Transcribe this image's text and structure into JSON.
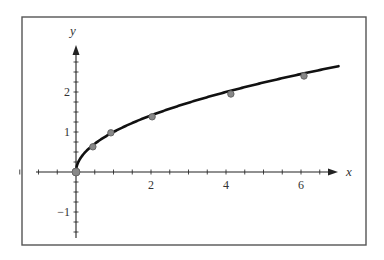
{
  "chart_data": {
    "type": "line",
    "title": "",
    "xlabel": "x",
    "ylabel": "y",
    "xlim": [
      -1.6,
      7.0
    ],
    "ylim": [
      -1.7,
      3.2
    ],
    "x_ticks": [
      2,
      4,
      6
    ],
    "x_tick_labels": [
      "2",
      "4",
      "6"
    ],
    "y_ticks": [
      -1,
      1,
      2
    ],
    "y_tick_labels": [
      "−1",
      "1",
      "2"
    ],
    "x_minor_step": 0.5,
    "y_minor_step": 0.25,
    "grid": false,
    "legend": null,
    "series": [
      {
        "name": "curve y = sqrt(x)",
        "kind": "line",
        "function": "sqrt",
        "x_range": [
          0,
          7.0
        ]
      },
      {
        "name": "data points",
        "kind": "scatter",
        "x": [
          0,
          0.45,
          0.93,
          2.03,
          4.13,
          6.08
        ],
        "y": [
          0,
          0.63,
          0.98,
          1.38,
          1.95,
          2.4
        ]
      }
    ]
  },
  "layout": {
    "frame": {
      "x": 22,
      "y": 17,
      "w": 344,
      "h": 228
    },
    "origin_px": [
      76,
      172
    ],
    "px_per_unit_x": 37.5,
    "px_per_unit_y": 40,
    "x_axis_px": [
      36,
      338
    ],
    "y_axis_px": [
      238,
      45
    ],
    "colors": {
      "curve": "#111111",
      "points": "#888888",
      "frame": "#555555"
    }
  }
}
